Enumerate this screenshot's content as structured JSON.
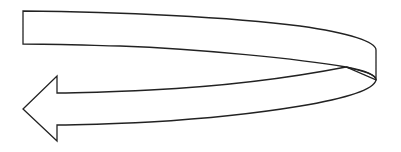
{
  "diagram": {
    "shape": "curved-u-turn-arrow",
    "colors": {
      "fill": "#ffffff",
      "stroke": "#222222",
      "background": "#ffffff"
    },
    "direction": "left"
  }
}
